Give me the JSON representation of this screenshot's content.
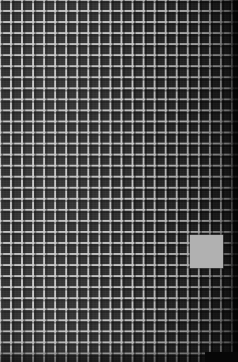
{
  "image": {
    "kind": "macro-photograph",
    "subject": "dark woven mesh screen",
    "width": 238,
    "height": 362,
    "caption": ""
  },
  "mesh": {
    "name": "grid-mesh",
    "cell_pitch_px": 11,
    "strand_width_px": 2,
    "opening_color": "#242424",
    "strand_color": "#cdcdcd",
    "columns": 22,
    "rows": 33
  },
  "lighting": {
    "bright_side": "left",
    "dark_side": "right",
    "vignette": "true",
    "right_edge_band_px": 9
  },
  "patch": {
    "name": "gray-square-patch",
    "color": "#b1b1b1",
    "x": 190,
    "y": 235,
    "width": 33,
    "height": 33,
    "label": ""
  },
  "corner_block": {
    "name": "dark-corner-block",
    "color": "#070707",
    "x": 205,
    "y": 352,
    "width": 33,
    "height": 10,
    "label": ""
  }
}
